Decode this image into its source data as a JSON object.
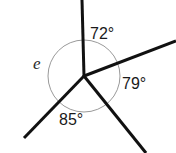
{
  "diagram": {
    "type": "angles-at-a-point",
    "background_color": "#ffffff",
    "ray_color": "#111111",
    "circle_color": "#9a9a9a",
    "vertex": {
      "x": 84,
      "y": 76
    },
    "circle": {
      "cx": 84,
      "cy": 76,
      "r": 36
    },
    "rays": [
      {
        "name": "ray-up",
        "direction_deg": 90,
        "x1": 84,
        "y1": 76,
        "x2": 82,
        "y2": 0,
        "width": 3
      },
      {
        "name": "ray-upper-right",
        "direction_deg": 18,
        "x1": 84,
        "y1": 76,
        "x2": 176,
        "y2": 41,
        "width": 3
      },
      {
        "name": "ray-lower-right",
        "direction_deg": -61,
        "x1": 84,
        "y1": 76,
        "x2": 146,
        "y2": 153,
        "width": 3
      },
      {
        "name": "ray-lower-left",
        "direction_deg": -145,
        "x1": 84,
        "y1": 76,
        "x2": 24,
        "y2": 138,
        "width": 3
      }
    ],
    "labels": [
      {
        "id": "label-72",
        "text": "72°",
        "x": 90,
        "y": 26,
        "kind": "angle"
      },
      {
        "id": "label-79",
        "text": "79°",
        "x": 122,
        "y": 76,
        "kind": "angle"
      },
      {
        "id": "label-85",
        "text": "85°",
        "x": 59,
        "y": 112,
        "kind": "angle"
      },
      {
        "id": "label-e",
        "text": "e",
        "x": 33,
        "y": 55,
        "kind": "unknown"
      }
    ]
  },
  "angles": {
    "known": [
      {
        "label": "72°",
        "value": 72,
        "between": [
          "ray-up",
          "ray-upper-right"
        ]
      },
      {
        "label": "79°",
        "value": 79,
        "between": [
          "ray-upper-right",
          "ray-lower-right"
        ]
      },
      {
        "label": "85°",
        "value": 85,
        "between": [
          "ray-lower-right",
          "ray-lower-left"
        ]
      }
    ],
    "unknown": {
      "label": "e",
      "between": [
        "ray-lower-left",
        "ray-up"
      ]
    },
    "angle_72": "72°",
    "angle_79": "79°",
    "angle_85": "85°",
    "angle_e": "e"
  }
}
